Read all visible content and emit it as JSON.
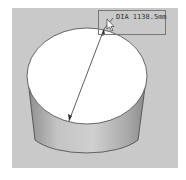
{
  "viewport": {
    "background": "#c9c9c9"
  },
  "model": {
    "shape": "cylinder",
    "top_face_color": "#ffffff",
    "side_color": "#b8b8b8"
  },
  "dimension": {
    "label": "DIA 1138.5mm",
    "type": "diameter"
  },
  "cursor": {
    "icon": "arrow-pointer-icon"
  }
}
